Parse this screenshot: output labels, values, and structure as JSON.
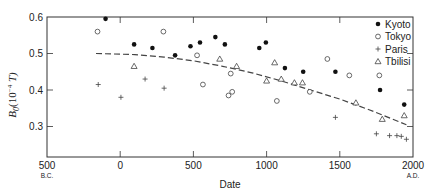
{
  "chart_data": {
    "type": "scatter",
    "title": "",
    "xlabel": "Date",
    "ylabel": "B0(10^-4 T)",
    "ylabel_parts": {
      "main": "B",
      "sub": "0",
      "rest": "(10",
      "sup": "−4",
      "end": " T)"
    },
    "xlim": [
      -500,
      2000
    ],
    "ylim": [
      0.22,
      0.6
    ],
    "x_ticks": [
      {
        "value": -500,
        "label": "500",
        "sublabel": "B.C."
      },
      {
        "value": 0,
        "label": "0",
        "sublabel": ""
      },
      {
        "value": 500,
        "label": "500",
        "sublabel": ""
      },
      {
        "value": 1000,
        "label": "1000",
        "sublabel": ""
      },
      {
        "value": 1500,
        "label": "1500",
        "sublabel": ""
      },
      {
        "value": 2000,
        "label": "2000",
        "sublabel": "A.D."
      }
    ],
    "y_ticks": [
      {
        "value": 0.6,
        "label": "0.6"
      },
      {
        "value": 0.5,
        "label": "0.5"
      },
      {
        "value": 0.4,
        "label": "0.4"
      },
      {
        "value": 0.3,
        "label": "0.3"
      }
    ],
    "grid": false,
    "legend_position": "upper right",
    "series": [
      {
        "name": "Kyoto",
        "marker": "filled-circle",
        "points": [
          [
            -100,
            0.595
          ],
          [
            95,
            0.525
          ],
          [
            220,
            0.515
          ],
          [
            375,
            0.495
          ],
          [
            480,
            0.52
          ],
          [
            545,
            0.53
          ],
          [
            650,
            0.545
          ],
          [
            715,
            0.525
          ],
          [
            950,
            0.515
          ],
          [
            995,
            0.53
          ],
          [
            1125,
            0.46
          ],
          [
            1250,
            0.45
          ],
          [
            1470,
            0.45
          ],
          [
            1775,
            0.4
          ],
          [
            1940,
            0.36
          ]
        ]
      },
      {
        "name": "Tokyo",
        "marker": "open-circle",
        "points": [
          [
            -155,
            0.56
          ],
          [
            295,
            0.56
          ],
          [
            525,
            0.495
          ],
          [
            565,
            0.415
          ],
          [
            740,
            0.385
          ],
          [
            755,
            0.445
          ],
          [
            765,
            0.395
          ],
          [
            1070,
            0.37
          ],
          [
            1295,
            0.395
          ],
          [
            1415,
            0.485
          ],
          [
            1565,
            0.44
          ],
          [
            1770,
            0.44
          ]
        ]
      },
      {
        "name": "Paris",
        "marker": "plus",
        "points": [
          [
            -150,
            0.415
          ],
          [
            5,
            0.38
          ],
          [
            170,
            0.43
          ],
          [
            300,
            0.405
          ],
          [
            1470,
            0.325
          ],
          [
            1750,
            0.28
          ],
          [
            1840,
            0.275
          ],
          [
            1890,
            0.275
          ],
          [
            1920,
            0.273
          ],
          [
            1955,
            0.265
          ]
        ]
      },
      {
        "name": "Tbilisi",
        "marker": "open-triangle",
        "points": [
          [
            95,
            0.465
          ],
          [
            680,
            0.485
          ],
          [
            795,
            0.465
          ],
          [
            1000,
            0.425
          ],
          [
            1055,
            0.475
          ],
          [
            1100,
            0.43
          ],
          [
            1190,
            0.42
          ],
          [
            1245,
            0.42
          ],
          [
            1610,
            0.365
          ],
          [
            1790,
            0.32
          ],
          [
            1940,
            0.33
          ]
        ]
      }
    ],
    "trend_line": {
      "style": "dashed",
      "points": [
        [
          -165,
          0.5
        ],
        [
          100,
          0.497
        ],
        [
          300,
          0.49
        ],
        [
          500,
          0.48
        ],
        [
          700,
          0.465
        ],
        [
          900,
          0.447
        ],
        [
          1100,
          0.425
        ],
        [
          1300,
          0.4
        ],
        [
          1500,
          0.375
        ],
        [
          1700,
          0.346
        ],
        [
          1955,
          0.305
        ]
      ]
    }
  }
}
